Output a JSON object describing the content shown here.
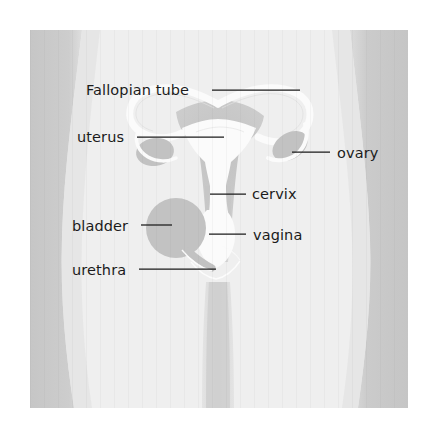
{
  "figure": {
    "canvas": {
      "width": 434,
      "height": 446
    },
    "background_color": "#ffffff",
    "body_fill": "#efefef",
    "body_shadow_fill": "#c9c9c9",
    "organ_gray": "#c2c2c2",
    "organ_white": "#fbfbfb",
    "label_color": "#1b1b1b"
  },
  "labels": [
    {
      "id": "fallopian-tube",
      "text": "Fallopian tube",
      "text_x": 86,
      "text_y": 95,
      "anchor": "start",
      "line": {
        "x1": 212,
        "y1": 90,
        "x2": 300,
        "y2": 90
      }
    },
    {
      "id": "uterus",
      "text": "uterus",
      "text_x": 77,
      "text_y": 142,
      "anchor": "start",
      "line": {
        "x1": 137,
        "y1": 137,
        "x2": 224,
        "y2": 137
      }
    },
    {
      "id": "ovary",
      "text": "ovary",
      "text_x": 337,
      "text_y": 158,
      "anchor": "start",
      "line": {
        "x1": 292,
        "y1": 152,
        "x2": 330,
        "y2": 152
      }
    },
    {
      "id": "cervix",
      "text": "cervix",
      "text_x": 252,
      "text_y": 199,
      "anchor": "start",
      "line": {
        "x1": 210,
        "y1": 194,
        "x2": 246,
        "y2": 194
      }
    },
    {
      "id": "bladder",
      "text": "bladder",
      "text_x": 72,
      "text_y": 231,
      "anchor": "start",
      "line": {
        "x1": 141,
        "y1": 225,
        "x2": 172,
        "y2": 225
      }
    },
    {
      "id": "vagina",
      "text": "vagina",
      "text_x": 253,
      "text_y": 240,
      "anchor": "start",
      "line": {
        "x1": 209,
        "y1": 234,
        "x2": 246,
        "y2": 234
      }
    },
    {
      "id": "urethra",
      "text": "urethra",
      "text_x": 72,
      "text_y": 275,
      "anchor": "start",
      "line": {
        "x1": 139,
        "y1": 269,
        "x2": 216,
        "y2": 269
      }
    }
  ],
  "organs": [
    {
      "id": "uterus-body",
      "name": "uterus",
      "shape": "triangular-body",
      "fill": "#fbfbfb"
    },
    {
      "id": "fallopian-tube-left",
      "name": "fallopian tube (left)",
      "shape": "curved-tube",
      "fill": "#fbfbfb"
    },
    {
      "id": "fallopian-tube-right",
      "name": "fallopian tube (right)",
      "shape": "curved-tube",
      "fill": "#fbfbfb"
    },
    {
      "id": "ovary-left",
      "name": "ovary (left)",
      "shape": "oval",
      "fill": "#c2c2c2"
    },
    {
      "id": "ovary-right",
      "name": "ovary (right)",
      "shape": "oval",
      "fill": "#c2c2c2"
    },
    {
      "id": "cervix",
      "name": "cervix",
      "shape": "narrow-neck",
      "fill": "#fbfbfb"
    },
    {
      "id": "vagina",
      "name": "vagina",
      "shape": "canal",
      "fill": "#fbfbfb"
    },
    {
      "id": "bladder",
      "name": "bladder",
      "shape": "circle",
      "fill": "#c2c2c2"
    },
    {
      "id": "urethra",
      "name": "urethra",
      "shape": "thin-tube",
      "fill": "#fbfbfb"
    }
  ]
}
